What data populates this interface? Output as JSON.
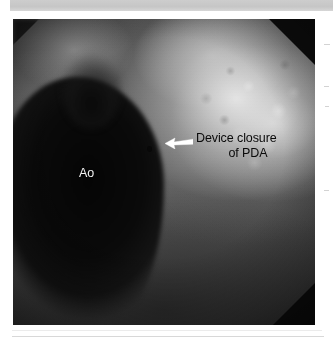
{
  "figure": {
    "type": "angiogram-fluoroscopy",
    "modality": "Aortic angiogram / fluoroscopy",
    "annotations": {
      "device": {
        "line1": "Device closure",
        "line2": "of PDA",
        "full_text": "Device closure of PDA",
        "color": "#0a0a0a",
        "arrow": {
          "icon": "arrow-left",
          "color": "#ffffff",
          "points_to": "device occluder in ductus arteriosus"
        }
      },
      "aorta": {
        "label": "Ao",
        "color": "#f2f2f2",
        "meaning": "Aorta"
      }
    },
    "regions": {
      "aorta_fill": "#0a0a0a",
      "soft_tissue": "#5c5c5c",
      "lung_field_bright": "#e8e8e8",
      "collimation_corner": "#0d0d0d"
    }
  },
  "page": {
    "background": "#ffffff",
    "top_band_color": "#c9c9c9",
    "rule_color": "#d8d8d8"
  }
}
